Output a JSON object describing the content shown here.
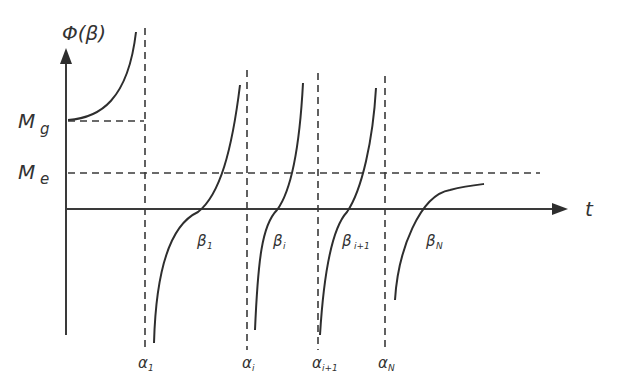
{
  "diagram": {
    "y_axis_label": "Φ(β)",
    "x_axis_label": "t",
    "levels": [
      {
        "id": "Mg",
        "main": "M",
        "sub": "g"
      },
      {
        "id": "Me",
        "main": "M",
        "sub": "e"
      }
    ],
    "poles": [
      {
        "main": "α",
        "sub": "1"
      },
      {
        "main": "α",
        "sub": "i"
      },
      {
        "main": "α",
        "sub": "i+1"
      },
      {
        "main": "α",
        "sub": "N"
      }
    ],
    "roots": [
      {
        "main": "β",
        "sub": "1"
      },
      {
        "main": "β",
        "sub": "i"
      },
      {
        "main": "β",
        "sub": "i+1"
      },
      {
        "main": "β",
        "sub": "N"
      }
    ],
    "colors": {
      "line": "#2e2e2e",
      "background": "#ffffff"
    }
  }
}
